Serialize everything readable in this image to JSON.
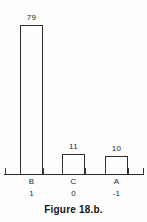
{
  "figure": {
    "caption": "Figure 18.b."
  },
  "chart_data": {
    "type": "bar",
    "title": "",
    "subtitle": "",
    "xlabel": "",
    "ylabel": "",
    "categories": [
      "B",
      "C",
      "A"
    ],
    "values": [
      79,
      11,
      10
    ],
    "value_labels": [
      "79",
      "11",
      "10"
    ],
    "secondary_tick_labels": [
      "1",
      "0",
      "-1"
    ],
    "ylim": [
      0,
      88
    ],
    "grid": false,
    "legend": false,
    "legend_position": "none",
    "bar_style": "outline",
    "axis_style": "x-axis only with ticks",
    "annotations": [
      "Figure 18.b."
    ]
  },
  "colors": {
    "background": "#fdfdfd",
    "ink": "#2b2b2b",
    "bar_outline": "#2e2e2e",
    "text": "#1f1f1f"
  }
}
